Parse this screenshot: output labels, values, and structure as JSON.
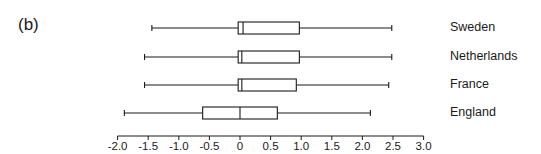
{
  "panel_label": "(b)",
  "chart_data": {
    "type": "boxplot",
    "orientation": "horizontal",
    "title": "",
    "xlabel": "",
    "ylabel": "",
    "xlim": [
      -2.0,
      3.0
    ],
    "x_ticks": [
      -2.0,
      -1.5,
      -1.0,
      -0.5,
      0,
      0.5,
      1.0,
      1.5,
      2.0,
      2.5,
      3.0
    ],
    "x_tick_labels": [
      "-2.0",
      "-1.5",
      "-1.0",
      "-0.5",
      "0",
      "0.5",
      "1.0",
      "1.5",
      "2.0",
      "2.5",
      "3.0"
    ],
    "grid": false,
    "categories": [
      "Sweden",
      "Netherlands",
      "France",
      "England"
    ],
    "series": [
      {
        "name": "Sweden",
        "min": -1.44,
        "q1": -0.03,
        "median": 0.05,
        "q3": 0.97,
        "max": 2.48
      },
      {
        "name": "Netherlands",
        "min": -1.56,
        "q1": -0.03,
        "median": 0.03,
        "q3": 0.97,
        "max": 2.48
      },
      {
        "name": "France",
        "min": -1.56,
        "q1": -0.03,
        "median": 0.03,
        "q3": 0.92,
        "max": 2.43
      },
      {
        "name": "England",
        "min": -1.89,
        "q1": -0.61,
        "median": 0.0,
        "q3": 0.61,
        "max": 2.13
      }
    ]
  },
  "colors": {
    "line": "#1a1a1a",
    "background": "#ffffff"
  }
}
